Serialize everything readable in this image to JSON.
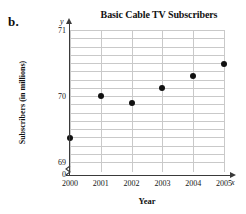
{
  "figure": {
    "part_label": "b."
  },
  "chart_data": {
    "type": "scatter",
    "title": "Basic Cable TV Subscribers",
    "xlabel": "Year",
    "ylabel": "Subscribers (in millions)",
    "x_axis_variable": "x",
    "y_axis_variable": "y",
    "categories": [
      "2000",
      "2001",
      "2002",
      "2003",
      "2004",
      "2005"
    ],
    "x": [
      2000,
      2001,
      2002,
      2003,
      2004,
      2005
    ],
    "values": [
      69.37,
      70.0,
      69.9,
      70.12,
      70.3,
      70.48
    ],
    "y_tick_labels": [
      "71",
      "70",
      "69",
      "0"
    ],
    "y_tick_values": [
      71,
      70,
      69,
      0
    ],
    "xlim": [
      2000,
      2005
    ],
    "ylim": [
      68.9,
      71.0
    ],
    "grid": true,
    "grid_spacing_y": 0.125,
    "legend": "none",
    "axis_break": true,
    "marker_color": "#111111",
    "grid_color": "#c9c9c9",
    "axis_color": "#3a3a3a"
  }
}
